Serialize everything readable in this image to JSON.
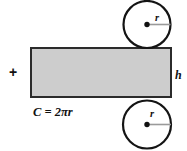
{
  "diagram": {
    "plus_sign": "+",
    "circumference_formula": "C = 2πr",
    "height_label": "h",
    "top_circle": {
      "radius_label": "r"
    },
    "bottom_circle": {
      "radius_label": "r"
    },
    "colors": {
      "rectangle_fill": "#cdcdcd",
      "rectangle_stroke": "#2b2b2b",
      "circle_fill": "#ffffff",
      "circle_stroke": "#141414",
      "radius_line": "#9a9a9a",
      "text": "#111111",
      "background": "#ffffff"
    }
  }
}
